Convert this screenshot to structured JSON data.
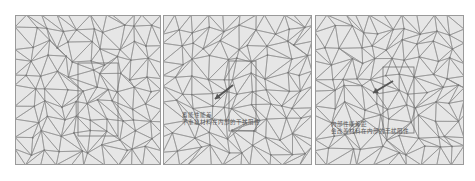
{
  "figure": {
    "background": "#ffffff",
    "mesh_fill": "#e6e6e6",
    "mesh_stroke": "#8c8c8c",
    "frame_stroke": "#9a9a9a",
    "panels": [
      {
        "id": "panel-1",
        "x": 15,
        "width": 146,
        "seed": 11,
        "inner_box": {
          "x": 63,
          "y": 48,
          "w": 40,
          "h": 73
        },
        "arrow": null,
        "labels": []
      },
      {
        "id": "panel-2",
        "x": 163,
        "width": 149,
        "seed": 23,
        "inner_box": {
          "x": 66,
          "y": 46,
          "w": 27,
          "h": 70
        },
        "arrow": {
          "x1": 70,
          "y1": 70,
          "x2": 52,
          "y2": 84
        },
        "labels": [
          "蓄能性能差",
          "不重复材料在内部的干扰阻性"
        ]
      },
      {
        "id": "panel-3",
        "x": 315,
        "width": 149,
        "seed": 37,
        "inner_box": {
          "x": 68,
          "y": 52,
          "w": 31,
          "h": 66
        },
        "arrow": {
          "x1": 78,
          "y1": 66,
          "x2": 58,
          "y2": 78
        },
        "labels": [
          "内部性能差距",
          "会改善材料在内部的干扰阻性"
        ]
      }
    ]
  }
}
